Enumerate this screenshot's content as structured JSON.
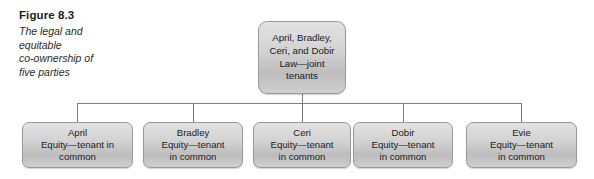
{
  "figure": {
    "number": "Figure 8.3",
    "description": "The legal and\nequitable\nco-ownership of\nfive parties"
  },
  "diagram": {
    "type": "hierarchy-tree",
    "root": {
      "id": "root",
      "label": "April, Bradley,\nCeri, and Dobir\nLaw—joint\ntenants"
    },
    "children": [
      {
        "id": "april",
        "label": "April\nEquity—tenant in\ncommon"
      },
      {
        "id": "bradley",
        "label": "Bradley\nEquity—tenant\nin common"
      },
      {
        "id": "ceri",
        "label": "Ceri\nEquity—tenant\nin common"
      },
      {
        "id": "dobir",
        "label": "Dobir\nEquity—tenant\nin common"
      },
      {
        "id": "evie",
        "label": "Evie\nEquity—tenant\nin common"
      }
    ],
    "colors": {
      "box_fill_top": "#e2e2e2",
      "box_fill_bottom": "#bdbdbd",
      "box_border": "#9a9a9a",
      "connector": "#7d7d7d",
      "text": "#1a1a1a"
    }
  }
}
